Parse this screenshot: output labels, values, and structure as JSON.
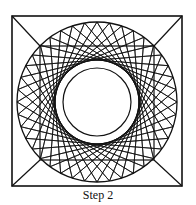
{
  "figure": {
    "caption": "Step 2",
    "stroke_color": "#111111",
    "background": "#ffffff",
    "outer_square": {
      "x": 12,
      "y": 16,
      "size": 170
    },
    "circle": {
      "cx": 97,
      "cy": 102,
      "r": 80
    },
    "inner_square": {
      "x": 40,
      "y": 46,
      "size": 114
    },
    "string_lines": {
      "points": 40,
      "skip": 13,
      "hole_radius": 34
    }
  }
}
